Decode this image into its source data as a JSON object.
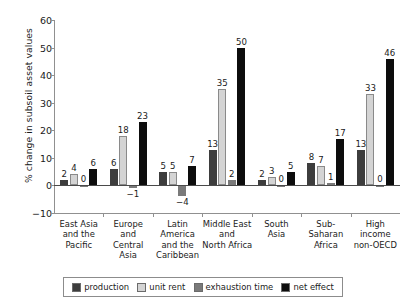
{
  "chart_data": {
    "type": "bar",
    "title": "",
    "xlabel": "",
    "ylabel": "% change in subsoil asset values",
    "ylim": [
      -10,
      60
    ],
    "yticks": [
      "60",
      "50",
      "40",
      "30",
      "20",
      "10",
      "0",
      "−10"
    ],
    "grid": false,
    "legend_position": "bottom",
    "categories": [
      "East Asia and the Pacific",
      "Europe and Central Asia",
      "Latin America and the Caribbean",
      "Middle East and North Africa",
      "South Asia",
      "Sub-Saharan Africa",
      "High income non-OECD"
    ],
    "category_lines": [
      [
        "East Asia",
        "and the",
        "Pacific"
      ],
      [
        "Europe",
        "and",
        "Central",
        "Asia"
      ],
      [
        "Latin",
        "America",
        "and the",
        "Caribbean"
      ],
      [
        "Middle East",
        "and",
        "North Africa"
      ],
      [
        "South",
        "Asia"
      ],
      [
        "Sub-",
        "Saharan",
        "Africa"
      ],
      [
        "High",
        "income",
        "non-OECD"
      ]
    ],
    "series": [
      {
        "name": "production",
        "color": "#3d3d3d",
        "values": [
          2,
          6,
          5,
          13,
          2,
          8,
          13
        ],
        "labels": [
          "2",
          "6",
          "5",
          "13",
          "2",
          "8",
          "13"
        ]
      },
      {
        "name": "unit rent",
        "color": "#d4d4d4",
        "values": [
          4,
          18,
          5,
          35,
          3,
          7,
          33
        ],
        "labels": [
          "4",
          "18",
          "5",
          "35",
          "3",
          "7",
          "33"
        ]
      },
      {
        "name": "exhaustion time",
        "color": "#7a7a7a",
        "values": [
          0,
          -1,
          -4,
          2,
          0,
          1,
          0
        ],
        "labels": [
          "0",
          "−1",
          "−4",
          "2",
          "0",
          "1",
          "0"
        ]
      },
      {
        "name": "net effect",
        "color": "#0d0d0d",
        "values": [
          6,
          23,
          7,
          50,
          5,
          17,
          46
        ],
        "labels": [
          "6",
          "23",
          "7",
          "50",
          "5",
          "17",
          "46"
        ]
      }
    ]
  },
  "legend": {
    "items": [
      {
        "label": "production",
        "color": "#3d3d3d"
      },
      {
        "label": "unit rent",
        "color": "#d4d4d4"
      },
      {
        "label": "exhaustion time",
        "color": "#7a7a7a"
      },
      {
        "label": "net effect",
        "color": "#0d0d0d"
      }
    ]
  }
}
